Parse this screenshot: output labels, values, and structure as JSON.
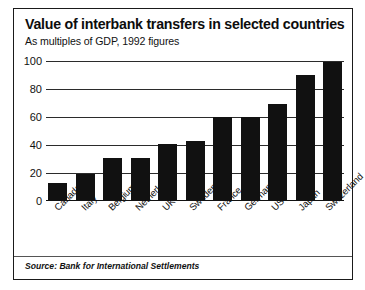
{
  "chart_data": {
    "type": "bar",
    "title": "Value of interbank transfers in selected countries",
    "subtitle": "As multiples of GDP, 1992 figures",
    "xlabel": "",
    "ylabel": "",
    "ylim": [
      0,
      100
    ],
    "yticks": [
      0,
      20,
      40,
      60,
      80,
      100
    ],
    "grid": true,
    "legend": "none",
    "bar_color": "#111111",
    "categories": [
      "Canada",
      "Italy",
      "Belgium",
      "Netherlands",
      "UK",
      "Sweden",
      "France",
      "Germany",
      "US",
      "Japan",
      "Switzerland"
    ],
    "values": [
      13,
      19,
      31,
      31,
      41,
      43,
      60,
      60,
      69,
      90,
      99
    ],
    "source": "Source: Bank for International Settlements"
  }
}
